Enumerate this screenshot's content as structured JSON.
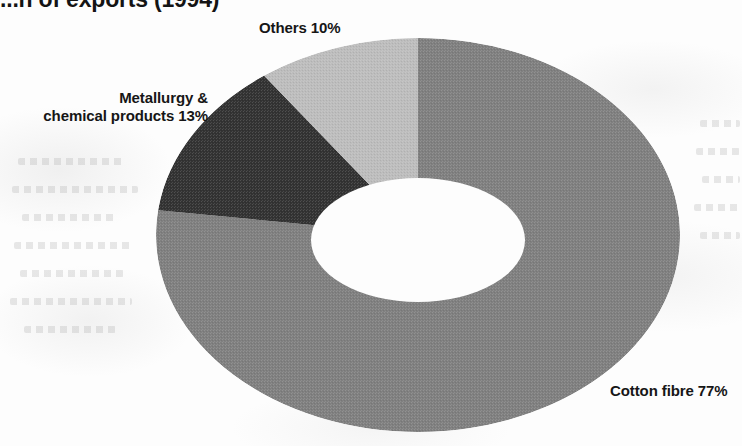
{
  "page": {
    "width": 742,
    "height": 446,
    "background_color": "#fdfdfd"
  },
  "chart_data": {
    "type": "pie",
    "variant": "donut",
    "title": "...n of exports (1994)",
    "subtitle": "",
    "xlabel": "",
    "ylabel": "",
    "legend_position": "none",
    "grid": false,
    "labels_inline": true,
    "units": "percent",
    "total": 100,
    "start_angle_deg": 0,
    "direction": "clockwise",
    "categories": [
      "Cotton fibre",
      "Metallurgy & chemical products",
      "Others"
    ],
    "values": [
      77,
      13,
      10
    ],
    "slices": [
      {
        "name": "Cotton fibre",
        "value": 77,
        "label": "Cotton fibre 77%",
        "color": "#808080",
        "label_position": "bottom-right"
      },
      {
        "name": "Metallurgy & chemical products",
        "value": 13,
        "label_line_1": "Metallurgy &",
        "label_line_2": "chemical products 13%",
        "color": "#333333",
        "label_position": "upper-left"
      },
      {
        "name": "Others",
        "value": 10,
        "label": "Others 10%",
        "color": "#bdbdbd",
        "label_position": "top"
      }
    ]
  },
  "labels": {
    "others": "Others 10%",
    "metallurgy_line1": "Metallurgy &",
    "metallurgy_line2": "chemical products 13%",
    "cotton": "Cotton fibre 77%"
  },
  "colors": {
    "cotton_fibre": "#808080",
    "metallurgy": "#333333",
    "others": "#bdbdbd",
    "hole": "#fdfdfd",
    "text": "#161616"
  },
  "geometry": {
    "center_x": 418,
    "center_y": 235,
    "outer_rx": 262,
    "outer_ry": 197,
    "inner_rx": 107,
    "inner_ry": 62
  }
}
